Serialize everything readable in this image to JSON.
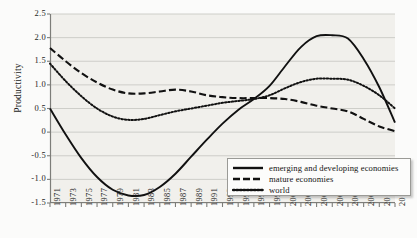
{
  "chart_data": {
    "type": "line",
    "title": "",
    "xlabel": "",
    "ylabel": "Productivity",
    "ylim": [
      -1.5,
      2.5
    ],
    "yticks": [
      "2.5",
      "2.0",
      "1.5",
      "1.0",
      "0.5",
      "0",
      "-0.5",
      "-1.0",
      "-1.5"
    ],
    "ytick_values": [
      2.5,
      2.0,
      1.5,
      1.0,
      0.5,
      0,
      -0.5,
      -1.0,
      -1.5
    ],
    "grid": "horizontal",
    "legend_position": "bottom-right",
    "categories": [
      "1971",
      "1973",
      "1975",
      "1977",
      "1979",
      "1981",
      "1983",
      "1985",
      "1987",
      "1989",
      "1991",
      "1993",
      "1995",
      "1997",
      "1999",
      "2001",
      "2003",
      "2005",
      "2006",
      "2007",
      "2009",
      "2011",
      "2013"
    ],
    "x": [
      1971,
      1973,
      1975,
      1977,
      1979,
      1981,
      1983,
      1985,
      1987,
      1989,
      1991,
      1993,
      1995,
      1997,
      1999,
      2001,
      2003,
      2005,
      2006,
      2007,
      2009,
      2011,
      2013
    ],
    "series": [
      {
        "name": "emerging and developing economies",
        "style": "solid",
        "color": "#111111",
        "values": [
          0.5,
          -0.05,
          -0.55,
          -0.95,
          -1.22,
          -1.34,
          -1.33,
          -1.16,
          -0.88,
          -0.52,
          -0.16,
          0.18,
          0.47,
          0.7,
          0.98,
          1.4,
          1.8,
          2.03,
          2.05,
          1.98,
          1.55,
          0.95,
          0.2
        ]
      },
      {
        "name": "mature economies",
        "style": "dashed",
        "color": "#111111",
        "values": [
          1.78,
          1.5,
          1.25,
          1.05,
          0.9,
          0.82,
          0.82,
          0.86,
          0.9,
          0.86,
          0.78,
          0.74,
          0.72,
          0.72,
          0.72,
          0.7,
          0.64,
          0.56,
          0.5,
          0.44,
          0.28,
          0.12,
          0.02
        ]
      },
      {
        "name": "world",
        "style": "dotted",
        "color": "#111111",
        "values": [
          1.45,
          1.08,
          0.76,
          0.5,
          0.33,
          0.26,
          0.28,
          0.36,
          0.44,
          0.5,
          0.56,
          0.62,
          0.66,
          0.7,
          0.78,
          0.93,
          1.06,
          1.13,
          1.13,
          1.11,
          0.98,
          0.78,
          0.5
        ]
      }
    ],
    "legend": [
      {
        "label": "emerging and developing economies",
        "style": "solid"
      },
      {
        "label": "mature economies",
        "style": "dashed"
      },
      {
        "label": "world",
        "style": "dotted"
      }
    ],
    "colors": {
      "plot_background": "#f1f0ec",
      "page_background": "#fbfbfa",
      "gridline": "#c9c9c5",
      "axis": "#7d7d79",
      "line": "#111111",
      "text": "#1b1b1b"
    }
  }
}
